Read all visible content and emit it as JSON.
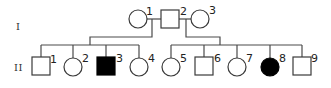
{
  "diagram": {
    "type": "pedigree",
    "generations": [
      {
        "label": "I",
        "individuals": [
          {
            "id": "1",
            "sex": "female",
            "affected": false
          },
          {
            "id": "2",
            "sex": "male",
            "affected": false
          },
          {
            "id": "3",
            "sex": "female",
            "affected": false
          }
        ]
      },
      {
        "label": "II",
        "individuals": [
          {
            "id": "1",
            "sex": "male",
            "affected": false,
            "parents": [
              "I-1",
              "I-2"
            ]
          },
          {
            "id": "2",
            "sex": "female",
            "affected": false,
            "parents": [
              "I-1",
              "I-2"
            ]
          },
          {
            "id": "3",
            "sex": "male",
            "affected": true,
            "parents": [
              "I-1",
              "I-2"
            ]
          },
          {
            "id": "4",
            "sex": "female",
            "affected": false,
            "parents": [
              "I-1",
              "I-2"
            ]
          },
          {
            "id": "5",
            "sex": "female",
            "affected": false,
            "parents": [
              "I-2",
              "I-3"
            ]
          },
          {
            "id": "6",
            "sex": "male",
            "affected": false,
            "parents": [
              "I-2",
              "I-3"
            ]
          },
          {
            "id": "7",
            "sex": "female",
            "affected": false,
            "parents": [
              "I-2",
              "I-3"
            ]
          },
          {
            "id": "8",
            "sex": "female",
            "affected": true,
            "parents": [
              "I-2",
              "I-3"
            ]
          },
          {
            "id": "9",
            "sex": "male",
            "affected": false,
            "parents": [
              "I-2",
              "I-3"
            ]
          }
        ]
      }
    ],
    "matings": [
      {
        "partners": [
          "I-1",
          "I-2"
        ],
        "children": [
          "II-1",
          "II-2",
          "II-3",
          "II-4"
        ]
      },
      {
        "partners": [
          "I-2",
          "I-3"
        ],
        "children": [
          "II-5",
          "II-6",
          "II-7",
          "II-8",
          "II-9"
        ]
      }
    ],
    "colors": {
      "affected": "#000000",
      "unaffected": "#ffffff",
      "outline": "#3a3a3a"
    }
  }
}
